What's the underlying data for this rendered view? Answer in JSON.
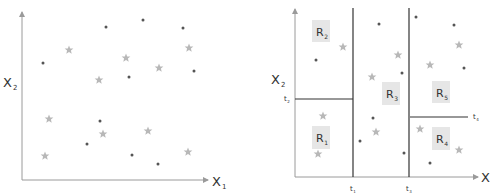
{
  "chart_data": [
    {
      "type": "scatter",
      "title": "",
      "xlabel": "X",
      "xlabel_sub": "1",
      "ylabel": "X",
      "ylabel_sub": "2",
      "grid": false,
      "series": [
        {
          "name": "dot",
          "marker": "dot",
          "color": "#555555",
          "points": [
            [
              106,
              27
            ],
            [
              143,
              20
            ],
            [
              183,
              28
            ],
            [
              43,
              63
            ],
            [
              129,
              77
            ],
            [
              194,
              71
            ],
            [
              100,
              121
            ],
            [
              87,
              144
            ],
            [
              132,
              155
            ],
            [
              158,
              164
            ]
          ]
        },
        {
          "name": "star",
          "marker": "star",
          "color": "#b8b8b8",
          "points": [
            [
              69,
              50
            ],
            [
              189,
              48
            ],
            [
              126,
              58
            ],
            [
              159,
              68
            ],
            [
              99,
              80
            ],
            [
              49,
              119
            ],
            [
              103,
              134
            ],
            [
              148,
              131
            ],
            [
              45,
              156
            ],
            [
              188,
              152
            ]
          ]
        }
      ]
    },
    {
      "type": "scatter",
      "title": "",
      "xlabel": "X",
      "ylabel": "X",
      "ylabel_sub": "2",
      "grid": false,
      "thresholds": [
        {
          "label": "t",
          "sub": "1",
          "axis": "x"
        },
        {
          "label": "t",
          "sub": "2",
          "axis": "y"
        },
        {
          "label": "t",
          "sub": "3",
          "axis": "x"
        },
        {
          "label": "t",
          "sub": "4",
          "axis": "y"
        }
      ],
      "regions": [
        {
          "label": "R",
          "sub": "1"
        },
        {
          "label": "R",
          "sub": "2"
        },
        {
          "label": "R",
          "sub": "3"
        },
        {
          "label": "R",
          "sub": "4"
        },
        {
          "label": "R",
          "sub": "5"
        }
      ],
      "series": [
        {
          "name": "dot",
          "marker": "dot",
          "color": "#555555",
          "points": [
            [
              379,
              24
            ],
            [
              416,
              17
            ],
            [
              454,
              25
            ],
            [
              316,
              60
            ],
            [
              402,
              73
            ],
            [
              464,
              68
            ],
            [
              373,
              118
            ],
            [
              360,
              141
            ],
            [
              404,
              153
            ],
            [
              430,
              163
            ]
          ]
        },
        {
          "name": "star",
          "marker": "star",
          "color": "#b8b8b8",
          "points": [
            [
              343,
              47
            ],
            [
              398,
              55
            ],
            [
              372,
              77
            ],
            [
              430,
              65
            ],
            [
              459,
              45
            ],
            [
              323,
              116
            ],
            [
              376,
              132
            ],
            [
              420,
              129
            ],
            [
              318,
              154
            ],
            [
              459,
              150
            ]
          ]
        }
      ]
    }
  ],
  "left": {
    "x_label": "X",
    "x_sub": "1",
    "y_label": "X",
    "y_sub": "2"
  },
  "right": {
    "x_label": "X",
    "y_label": "X",
    "y_sub": "2",
    "t1": "t",
    "t1_sub": "1",
    "t2": "t",
    "t2_sub": "2",
    "t3": "t",
    "t3_sub": "3",
    "t4": "t",
    "t4_sub": "4",
    "r1": "R",
    "r1_sub": "1",
    "r2": "R",
    "r2_sub": "2",
    "r3": "R",
    "r3_sub": "3",
    "r4": "R",
    "r4_sub": "4",
    "r5": "R",
    "r5_sub": "5"
  },
  "colors": {
    "axis": "#9a9a9a",
    "split": "#333333",
    "dot": "#555555",
    "star": "#b8b8b8",
    "region_box": "#e6e6e6"
  }
}
